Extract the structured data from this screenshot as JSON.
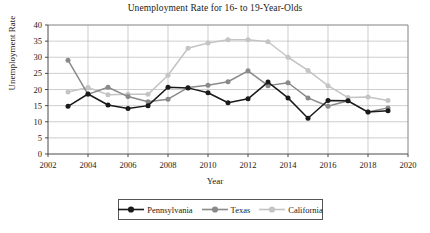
{
  "chart_data": {
    "type": "line",
    "title": "Unemployment Rate for 16- to 19-Year-Olds",
    "xlabel": "Year",
    "ylabel": "Unemployment Rate",
    "xlim": [
      2002,
      2020
    ],
    "ylim": [
      0,
      40
    ],
    "xticks": [
      2002,
      2004,
      2006,
      2008,
      2010,
      2012,
      2014,
      2016,
      2018,
      2020
    ],
    "yticks": [
      0,
      5,
      10,
      15,
      20,
      25,
      30,
      35,
      40
    ],
    "grid": true,
    "legend_position": "bottom",
    "x": [
      2003,
      2004,
      2005,
      2006,
      2007,
      2008,
      2009,
      2010,
      2011,
      2012,
      2013,
      2014,
      2015,
      2016,
      2017,
      2018,
      2019
    ],
    "series": [
      {
        "name": "Pennsylvania",
        "color": "#1a1a1a",
        "values": [
          14.8,
          18.6,
          15.2,
          14.1,
          15.0,
          20.7,
          20.5,
          19.0,
          15.9,
          17.1,
          22.3,
          17.4,
          11.1,
          16.6,
          16.5,
          13.0,
          13.4
        ]
      },
      {
        "name": "Texas",
        "color": "#8a8a8a",
        "values": [
          29.1,
          18.5,
          20.7,
          17.8,
          16.2,
          17.0,
          20.6,
          21.3,
          22.4,
          25.8,
          21.2,
          22.1,
          17.4,
          14.8,
          16.5,
          13.0,
          14.3
        ]
      },
      {
        "name": "California",
        "color": "#c4c4c4",
        "values": [
          19.2,
          20.6,
          18.4,
          18.5,
          18.5,
          24.4,
          32.8,
          34.4,
          35.4,
          35.4,
          34.8,
          30.0,
          25.9,
          21.2,
          17.5,
          17.7,
          16.6
        ]
      }
    ]
  },
  "legend": {
    "items": [
      {
        "label": "Pennsylvania"
      },
      {
        "label": "Texas"
      },
      {
        "label": "California"
      }
    ]
  }
}
